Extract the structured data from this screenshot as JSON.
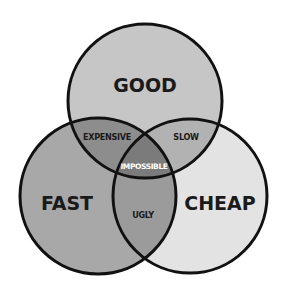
{
  "diagram": {
    "type": "venn-3",
    "circles": [
      {
        "id": "good",
        "label": "GOOD",
        "cx": 145,
        "cy": 101,
        "r": 77,
        "fill": "#c6c6c6"
      },
      {
        "id": "fast",
        "label": "FAST",
        "cx": 98,
        "cy": 196,
        "r": 78,
        "fill": "#a8a8a8"
      },
      {
        "id": "cheap",
        "label": "CHEAP",
        "cx": 190,
        "cy": 196,
        "r": 77,
        "fill": "#e3e3e3"
      }
    ],
    "intersections": {
      "good_fast": {
        "label": "EXPENSIVE",
        "fill": "#8d8d8d"
      },
      "good_cheap": {
        "label": "SLOW",
        "fill": "#b2b2b2"
      },
      "fast_cheap": {
        "label": "UGLY",
        "fill": "#9b9b9b"
      },
      "all": {
        "label": "IMPOSSIBLE",
        "fill": "#7b7b7b"
      }
    },
    "stroke": "#111111",
    "stroke_width": 3
  }
}
